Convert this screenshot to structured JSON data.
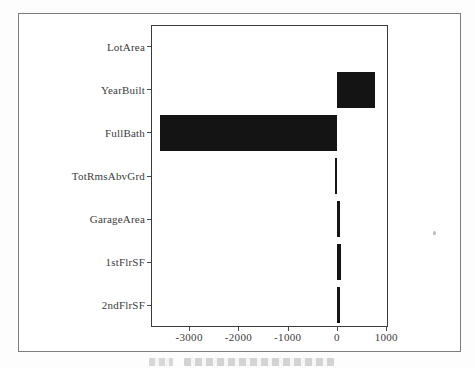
{
  "figure": {
    "background": "#ffffff",
    "frame_color": "#7d7d7d",
    "plot_border_color": "#3c3c3c",
    "bar_color": "#141414",
    "text_color": "#3b3b3b"
  },
  "chart_data": {
    "type": "bar",
    "orientation": "horizontal",
    "title": "",
    "xlabel": "",
    "ylabel": "",
    "grid": false,
    "legend": null,
    "categories": [
      "LotArea",
      "YearBuilt",
      "FullBath",
      "TotRmsAbvGrd",
      "GarageArea",
      "1stFlrSF",
      "2ndFlrSF"
    ],
    "values": [
      0,
      780,
      -3600,
      -40,
      60,
      80,
      70
    ],
    "xlim": [
      -3773,
      1034
    ],
    "x_ticks": [
      -3000,
      -2000,
      -1000,
      0,
      1000
    ],
    "x_tick_labels": [
      "-3000",
      "-2000",
      "-1000",
      "0",
      "1000"
    ]
  },
  "caption": {
    "present": true,
    "legible": false,
    "text": ""
  }
}
